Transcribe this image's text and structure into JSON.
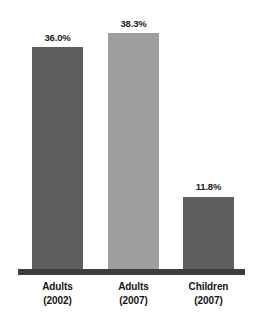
{
  "chart_data": {
    "type": "bar",
    "title": "",
    "subtitle": "",
    "xlabel": "",
    "ylabel": "",
    "legend": [],
    "grid": false,
    "ylim": [
      0,
      38.3
    ],
    "categories": [
      "Adults (2002)",
      "Adults (2007)",
      "Children (2007)"
    ],
    "category_lines": [
      {
        "name": "Adults",
        "year": "(2002)"
      },
      {
        "name": "Adults",
        "year": "(2007)"
      },
      {
        "name": "Children",
        "year": "(2007)"
      }
    ],
    "values": [
      36.0,
      38.3,
      11.8
    ],
    "value_labels": [
      "36.0%",
      "38.3%",
      "11.8%"
    ],
    "bar_colors": [
      "#5e5e5e",
      "#9e9e9e",
      "#5e5e5e"
    ],
    "axis_color": "#3d3d3d",
    "background_color": "#ffffff",
    "label_color": "#141414"
  }
}
